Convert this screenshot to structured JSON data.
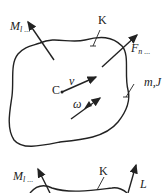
{
  "diagram": {
    "type": "rigid-body-mechanics",
    "top_body": {
      "labels": {
        "moment": "M",
        "moment_sub": "l ...",
        "point_k": "K",
        "force": "F",
        "force_sub": "n ...",
        "center": "C",
        "velocity": "v",
        "angular_velocity": "ω",
        "mass_inertia": "m,J"
      }
    },
    "bottom_body": {
      "labels": {
        "moment": "M",
        "moment_sub": "l ...",
        "point_k": "K",
        "angular_momentum": "L"
      }
    },
    "colors": {
      "stroke": "#222222",
      "background": "#ffffff"
    }
  }
}
